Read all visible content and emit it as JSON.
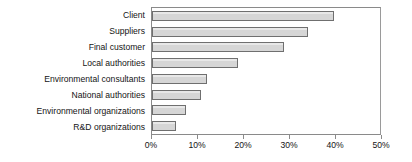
{
  "chart_data": {
    "type": "bar",
    "orientation": "horizontal",
    "title": "",
    "subtitle": "",
    "xlabel": "",
    "ylabel": "",
    "categories": [
      "Client",
      "Suppliers",
      "Final customer",
      "Local authorities",
      "Environmental consultants",
      "National authorities",
      "Environmental organizations",
      "R&D organizations"
    ],
    "values": [
      39.6,
      33.9,
      28.7,
      18.7,
      12.0,
      10.6,
      7.4,
      5.2
    ],
    "value_unit": "%",
    "xlim": [
      0,
      50
    ],
    "xticks": [
      0,
      10,
      20,
      30,
      40,
      50
    ],
    "xtick_labels": [
      "0%",
      "10%",
      "20%",
      "30%",
      "40%",
      "50%"
    ],
    "grid": false,
    "legend": null,
    "legend_position": "none",
    "series": [
      {
        "name": "",
        "values": [
          39.6,
          33.9,
          28.7,
          18.7,
          12.0,
          10.6,
          7.4,
          5.2
        ]
      }
    ],
    "colors": {
      "bar_fill": "#d6d6d6",
      "bar_border": "#6f6f6f",
      "axis": "#8a8a8a",
      "text": "#141414",
      "background": "#ffffff"
    }
  }
}
